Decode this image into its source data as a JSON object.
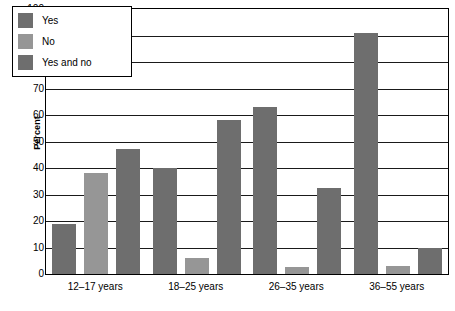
{
  "chart_data": {
    "type": "bar",
    "title": "",
    "xlabel": "",
    "ylabel": "Percent",
    "ylim": [
      0,
      100
    ],
    "ytick_step": 10,
    "yticks": [
      100,
      90,
      80,
      70,
      60,
      50,
      40,
      30,
      20,
      10,
      0
    ],
    "grid": true,
    "legend_position": "top-left-inside",
    "categories": [
      "12–17 years",
      "18–25 years",
      "26–35 years",
      "36–55 years"
    ],
    "series": [
      {
        "name": "Yes",
        "color": "#6e6e6e",
        "values": [
          19,
          40,
          63,
          91
        ]
      },
      {
        "name": "No",
        "color": "#969696",
        "values": [
          38,
          6,
          2.5,
          3
        ]
      },
      {
        "name": "Yes and no",
        "color": "#6e6e6e",
        "values": [
          47,
          58,
          32.5,
          10
        ]
      }
    ]
  },
  "legend": {
    "items": [
      {
        "label": "Yes",
        "color": "#6e6e6e"
      },
      {
        "label": "No",
        "color": "#969696"
      },
      {
        "label": "Yes and no",
        "color": "#6e6e6e"
      }
    ]
  },
  "axes": {
    "y_title": "Percent"
  }
}
